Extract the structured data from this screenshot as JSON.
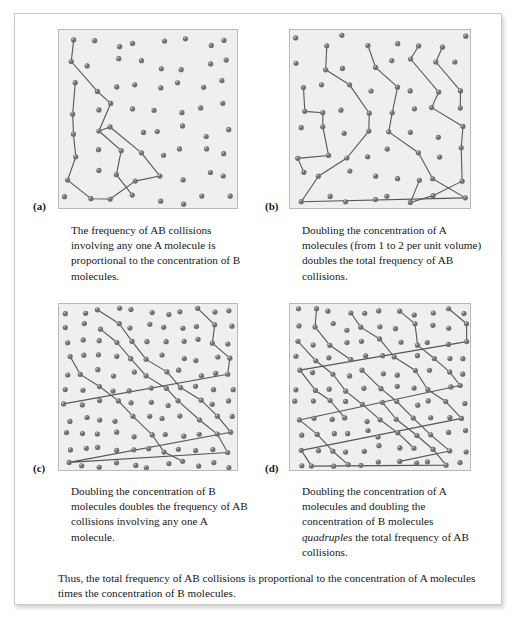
{
  "figure": {
    "panels": [
      {
        "id": "a",
        "label": "(a)",
        "caption": "The frequency of AB collisions involving any one A molecule is proportional to the concentration of B molecules.",
        "dot_count": 58,
        "density": "1x"
      },
      {
        "id": "b",
        "label": "(b)",
        "caption": "Doubling the concentration of A molecules (from 1 to 2 per unit volume) doubles the total frequency of AB collisions.",
        "dot_count": 58,
        "density": "1x"
      },
      {
        "id": "c",
        "label": "(c)",
        "caption_parts": {
          "before": "Doubling the concentration of B molecules doubles the frequency of AB collisions involving any one A molecule.",
          "emphasis": "",
          "after": ""
        },
        "caption": "Doubling the concentration of B molecules doubles the frequency of AB collisions involving any one A molecule.",
        "dot_count": 116,
        "density": "2x"
      },
      {
        "id": "d",
        "label": "(d)",
        "caption_parts": {
          "before": "Doubling the concentration of A molecules and doubling the concentration of B molecules ",
          "emphasis": "quadruples",
          "after": " the total frequency of AB collisions."
        },
        "caption": "Doubling the concentration of A molecules and doubling the concentration of B molecules quadruples the total frequency of AB collisions.",
        "dot_count": 116,
        "density": "2x"
      }
    ],
    "summary": "Thus, the total frequency of AB collisions is proportional to the concentration of A molecules times the concentration of B molecules.",
    "colors": {
      "panel_background": "#efefef",
      "panel_border": "#b9b9b9",
      "molecule_fill": "#6f6f74",
      "molecule_highlight": "#c9c9ce",
      "path_stroke": "#55555c",
      "page_background": "#ffffff",
      "text": "#16161a"
    },
    "molecule_radius": 2.6,
    "path_stroke_width": 1.1
  }
}
